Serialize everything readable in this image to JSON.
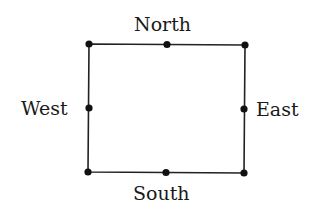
{
  "diagram": {
    "labels": {
      "north": "North",
      "south": "South",
      "east": "East",
      "west": "West"
    },
    "colors": {
      "stroke": "#222222",
      "text": "#1a1a1a",
      "background": "#ffffff"
    },
    "points": [
      {
        "name": "north-west-corner",
        "x": 89,
        "y": 44
      },
      {
        "name": "north-midpoint",
        "x": 167,
        "y": 44
      },
      {
        "name": "north-east-corner",
        "x": 245,
        "y": 45
      },
      {
        "name": "west-midpoint",
        "x": 89,
        "y": 108
      },
      {
        "name": "east-midpoint",
        "x": 244,
        "y": 109
      },
      {
        "name": "south-west-corner",
        "x": 88,
        "y": 172
      },
      {
        "name": "south-midpoint",
        "x": 166,
        "y": 172
      },
      {
        "name": "south-east-corner",
        "x": 244,
        "y": 173
      }
    ]
  }
}
